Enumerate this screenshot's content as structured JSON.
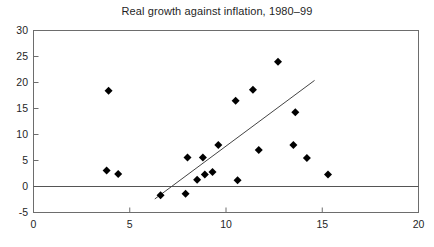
{
  "chart_data": {
    "type": "scatter",
    "title": "Real growth against inflation, 1980–99",
    "xlabel": "",
    "ylabel": "",
    "xlim": [
      0,
      20
    ],
    "ylim": [
      -5,
      30
    ],
    "xticks": [
      0,
      5,
      10,
      15,
      20
    ],
    "yticks": [
      -5,
      0,
      5,
      10,
      15,
      20,
      25,
      30
    ],
    "xtick_labels": [
      "0",
      "5",
      "10",
      "15",
      "20"
    ],
    "ytick_labels": [
      "-5",
      "0",
      "5",
      "10",
      "15",
      "20",
      "25",
      "30"
    ],
    "grid": false,
    "legend": null,
    "marker": "diamond",
    "marker_color": "#000000",
    "zero_line": {
      "y": 0,
      "color": "#555555"
    },
    "points": [
      {
        "x": 3.9,
        "y": 18.4
      },
      {
        "x": 3.8,
        "y": 3.1
      },
      {
        "x": 4.4,
        "y": 2.4
      },
      {
        "x": 6.6,
        "y": -1.7
      },
      {
        "x": 7.9,
        "y": -1.4
      },
      {
        "x": 8.0,
        "y": 5.6
      },
      {
        "x": 8.5,
        "y": 1.3
      },
      {
        "x": 8.8,
        "y": 5.6
      },
      {
        "x": 8.9,
        "y": 2.3
      },
      {
        "x": 9.3,
        "y": 2.8
      },
      {
        "x": 9.6,
        "y": 8.0
      },
      {
        "x": 10.5,
        "y": 16.5
      },
      {
        "x": 10.6,
        "y": 1.2
      },
      {
        "x": 11.4,
        "y": 18.6
      },
      {
        "x": 11.7,
        "y": 7.0
      },
      {
        "x": 12.7,
        "y": 24.0
      },
      {
        "x": 13.6,
        "y": 14.3
      },
      {
        "x": 13.5,
        "y": 8.0
      },
      {
        "x": 14.2,
        "y": 5.5
      },
      {
        "x": 15.3,
        "y": 2.3
      }
    ],
    "trendline": {
      "x0": 6.3,
      "y0": -2.4,
      "x1": 14.6,
      "y1": 20.4,
      "color": "#444444"
    }
  }
}
